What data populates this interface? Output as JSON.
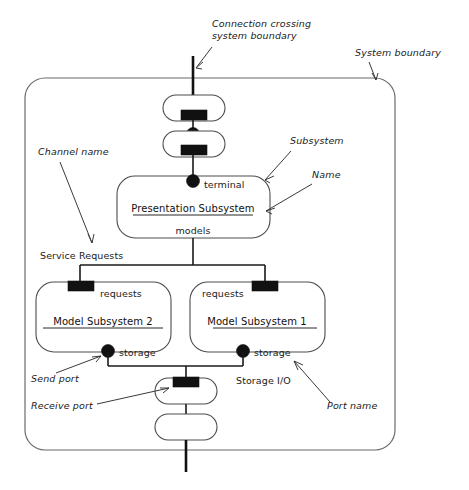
{
  "diagram": {
    "colors": {
      "boundary_stroke": "#6b6b6b",
      "shape_stroke": "#4c4c4c",
      "connection_stroke": "#1a1a1a",
      "port_fill": "#111111",
      "annotation_stroke": "#3a3a3a",
      "text": "#1a1a1a",
      "background": "#ffffff"
    }
  },
  "annotations": {
    "connection_crossing_line1": "Connection crossing",
    "connection_crossing_line2": "system boundary",
    "system_boundary": "System boundary",
    "channel_name": "Channel name",
    "subsystem": "Subsystem",
    "name": "Name",
    "send_port": "Send port",
    "receive_port": "Receive port",
    "port_name": "Port name"
  },
  "nodes": {
    "presentation": {
      "name": "Presentation Subsystem",
      "top_port_label": "terminal",
      "bottom_port_label": "models"
    },
    "model_subsystem_2": {
      "name": "Model Subsystem 2",
      "top_port_label": "requests",
      "bottom_port_label": "storage"
    },
    "model_subsystem_1": {
      "name": "Model Subsystem 1",
      "top_port_label": "requests",
      "bottom_port_label": "storage"
    }
  },
  "channels": {
    "service_requests": "Service Requests",
    "storage_io": "Storage I/O"
  },
  "ports": {
    "top_outer_receive": "receive-port",
    "top_inner_send": "send-port",
    "presentation_terminal": "send-port",
    "presentation_models": "connector",
    "model2_requests": "receive-port",
    "model1_requests": "receive-port",
    "model2_storage": "send-port",
    "model1_storage": "send-port",
    "bottom_receive": "receive-port"
  }
}
